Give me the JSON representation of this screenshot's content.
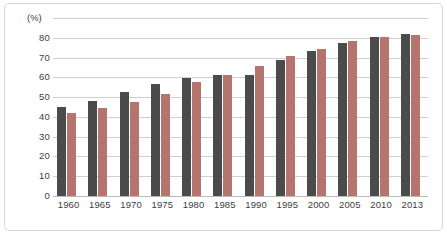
{
  "chart_data": {
    "type": "bar",
    "title": "",
    "subtitle": "",
    "xlabel": "",
    "ylabel": "",
    "unit_label": "(%)",
    "ylim": [
      0,
      90
    ],
    "yticks": [
      0,
      10,
      20,
      30,
      40,
      50,
      60,
      70,
      80
    ],
    "ytick_labels": [
      "0",
      "10",
      "20",
      "30",
      "40",
      "50",
      "60",
      "70",
      "80"
    ],
    "grid": true,
    "legend": false,
    "legend_position": "none",
    "categories": [
      "1960",
      "1965",
      "1970",
      "1975",
      "1980",
      "1985",
      "1990",
      "1995",
      "2000",
      "2005",
      "2010",
      "2013"
    ],
    "series": [
      {
        "name": "series-dark",
        "color": "#4b4b4b",
        "values": [
          45.0,
          48.0,
          52.5,
          56.5,
          59.5,
          61.0,
          61.0,
          69.0,
          73.5,
          77.5,
          80.5,
          82.0
        ]
      },
      {
        "name": "series-red",
        "color": "#b5756e",
        "values": [
          42.0,
          44.5,
          47.5,
          51.5,
          57.5,
          61.0,
          65.5,
          71.0,
          74.5,
          78.5,
          80.5,
          81.5
        ]
      }
    ],
    "colors": {
      "dark_bar": "#4b4b4b",
      "red_bar": "#b5756e",
      "gridline": "#cfcfcf",
      "axis": "#b9b9b9",
      "frame": "#d9d3d1",
      "text": "#3d3d3d",
      "background": "#ffffff"
    }
  }
}
